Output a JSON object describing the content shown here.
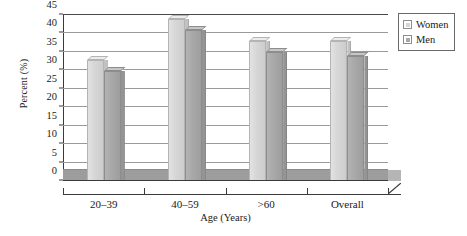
{
  "chart_data": {
    "type": "bar",
    "title": "",
    "subtitle": "",
    "xlabel": "Age (Years)",
    "ylabel": "Percent (%)",
    "categories": [
      "20–39",
      "40–59",
      ">60",
      "Overall"
    ],
    "series": [
      {
        "name": "Women",
        "values": [
          31,
          42,
          36,
          36
        ],
        "color": "#d6d6d6"
      },
      {
        "name": "Men",
        "values": [
          28,
          39,
          33,
          32
        ],
        "color": "#a8a8a8"
      }
    ],
    "ylim": [
      0,
      45
    ],
    "yticks": [
      0,
      5,
      10,
      15,
      20,
      25,
      30,
      35,
      40,
      45
    ],
    "ytick_labels": [
      "0",
      "5",
      "10",
      "15",
      "20",
      "25",
      "30",
      "35",
      "40",
      "45"
    ],
    "grid": true,
    "grid_axis": "y",
    "legend_position": "top-right",
    "style": "3d-grayscale"
  },
  "legend": {
    "entries": [
      {
        "label": "Women",
        "swatch": "women-swatch-icon"
      },
      {
        "label": "Men",
        "swatch": "men-swatch-icon"
      }
    ]
  },
  "axes": {
    "y_title": "Percent (%)",
    "x_title": "Age (Years)"
  }
}
